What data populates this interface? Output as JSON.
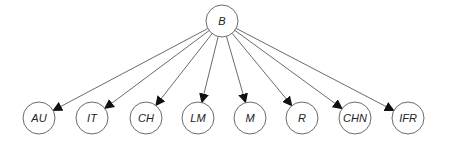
{
  "diagram": {
    "type": "tree",
    "root": {
      "id": "B",
      "label": "B",
      "cx": 222,
      "cy": 21
    },
    "children": [
      {
        "id": "AU",
        "label": "AU",
        "cx": 39,
        "cy": 118
      },
      {
        "id": "IT",
        "label": "IT",
        "cx": 92,
        "cy": 118
      },
      {
        "id": "CH",
        "label": "CH",
        "cx": 146,
        "cy": 118
      },
      {
        "id": "LM",
        "label": "LM",
        "cx": 198,
        "cy": 118
      },
      {
        "id": "M",
        "label": "M",
        "cx": 250,
        "cy": 118
      },
      {
        "id": "R",
        "label": "R",
        "cx": 302,
        "cy": 118
      },
      {
        "id": "CHN",
        "label": "CHN",
        "cx": 355,
        "cy": 118
      },
      {
        "id": "IFR",
        "label": "IFR",
        "cx": 408,
        "cy": 118
      }
    ],
    "edges": [
      {
        "from": "B",
        "to": "AU"
      },
      {
        "from": "B",
        "to": "IT"
      },
      {
        "from": "B",
        "to": "CH"
      },
      {
        "from": "B",
        "to": "LM"
      },
      {
        "from": "B",
        "to": "M"
      },
      {
        "from": "B",
        "to": "R"
      },
      {
        "from": "B",
        "to": "CHN"
      },
      {
        "from": "B",
        "to": "IFR"
      }
    ],
    "node_radius": 16,
    "colors": {
      "stroke": "#6b6b6b",
      "arrow": "#111111",
      "text": "#222222"
    }
  }
}
